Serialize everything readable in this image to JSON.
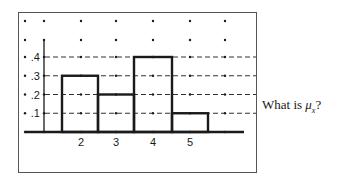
{
  "chart_data": {
    "type": "bar",
    "title": "",
    "subtitle": "",
    "xlabel": "",
    "ylabel": "",
    "categories": [
      "2",
      "3",
      "4",
      "5"
    ],
    "values": [
      0.3,
      0.2,
      0.4,
      0.1
    ],
    "x_tick_labels": [
      "2",
      "3",
      "4",
      "5"
    ],
    "y_tick_labels": [
      ".1",
      ".2",
      ".3",
      ".4"
    ],
    "y_ticks": [
      0.1,
      0.2,
      0.3,
      0.4
    ],
    "ylim": [
      0,
      0.5
    ],
    "grid": "dashed horizontal lines at .1, .2, .3, .4 with dot grid",
    "legend": null,
    "annotations": [
      "What is μₓ?"
    ],
    "style": "histogram / probability distribution with adjacent bars"
  },
  "question": {
    "prefix": "What is ",
    "symbol": "μ",
    "subscript": "x",
    "suffix": "?"
  },
  "colors": {
    "ink": "#1a1a1a",
    "frame": "#555555",
    "background": "#ffffff"
  }
}
